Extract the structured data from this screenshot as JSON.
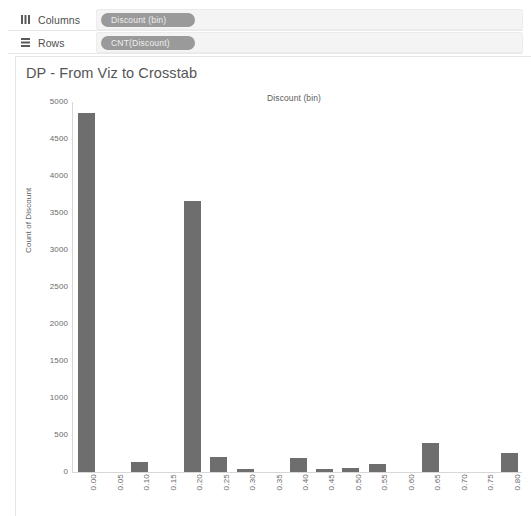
{
  "shelves": {
    "columns": {
      "label": "Columns",
      "icon": "columns-icon",
      "pill": "Discount (bin)"
    },
    "rows": {
      "label": "Rows",
      "icon": "rows-icon",
      "pill": "CNT(Discount)"
    }
  },
  "worksheet": {
    "title": "DP - From Viz to Crosstab",
    "column_header": "Discount (bin)"
  },
  "colors": {
    "bar": "#6e6e6e",
    "pill": "#9a9a9a",
    "axis": "#d7d7d7",
    "text": "#5d5d5d"
  },
  "chart_data": {
    "type": "bar",
    "title": "Discount (bin)",
    "xlabel": "Discount (bin)",
    "ylabel": "Count of Discount",
    "ylim": [
      0,
      5000
    ],
    "ytick_step": 500,
    "yticks": [
      5000,
      4500,
      4000,
      3500,
      3000,
      2500,
      2000,
      1500,
      1000,
      500,
      0
    ],
    "grid": false,
    "legend": "none",
    "categories": [
      "0.00",
      "0.05",
      "0.10",
      "0.15",
      "0.20",
      "0.25",
      "0.30",
      "0.35",
      "0.40",
      "0.45",
      "0.50",
      "0.55",
      "0.60",
      "0.65",
      "0.70",
      "0.75",
      "0.80"
    ],
    "values": [
      4850,
      0,
      130,
      0,
      3660,
      200,
      30,
      0,
      185,
      10,
      60,
      105,
      0,
      395,
      0,
      0,
      255
    ]
  }
}
